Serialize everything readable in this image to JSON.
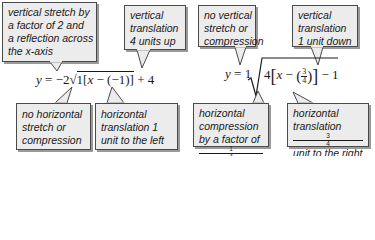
{
  "equation1": {
    "lhs": "y",
    "equals": "=",
    "a": "−2",
    "radical": "√",
    "b": "1",
    "open": "[",
    "x": "x",
    "minus": "−",
    "h": "(−1)",
    "close": "]",
    "plus": "+",
    "k": "4"
  },
  "equation2": {
    "lhs": "y",
    "equals": "=",
    "a": "1",
    "b": "4",
    "x": "x",
    "minus": "−",
    "h_num": "3",
    "h_den": "4",
    "k_sign": "−",
    "k": "1"
  },
  "callouts_top": [
    {
      "lines": [
        "vertical stretch by",
        "a factor of 2 and",
        "a reflection across",
        "the x-axis"
      ]
    },
    {
      "lines": [
        "vertical",
        "translation",
        "4 units up"
      ]
    },
    {
      "lines": [
        "no vertical",
        "stretch or",
        "compression"
      ]
    },
    {
      "lines": [
        "vertical",
        "translation",
        "1 unit down"
      ]
    }
  ],
  "callouts_bottom": [
    {
      "lines": [
        "no horizontal",
        "stretch or",
        "compression"
      ]
    },
    {
      "lines": [
        "horizontal",
        "translation 1",
        "unit to the left"
      ]
    },
    {
      "lines": [
        "horizontal",
        "compression",
        "by a factor of"
      ],
      "frac": {
        "num": "1",
        "den": "4"
      }
    },
    {
      "lines": [
        "horizontal",
        "translation",
        "unit to the right"
      ],
      "frac": {
        "num": "3",
        "den": "4"
      }
    }
  ],
  "colors": {
    "box_fill": "#ececec",
    "box_border": "#4a4a4a",
    "shadow": "#9a9a9a",
    "text": "#1a1a1a"
  }
}
